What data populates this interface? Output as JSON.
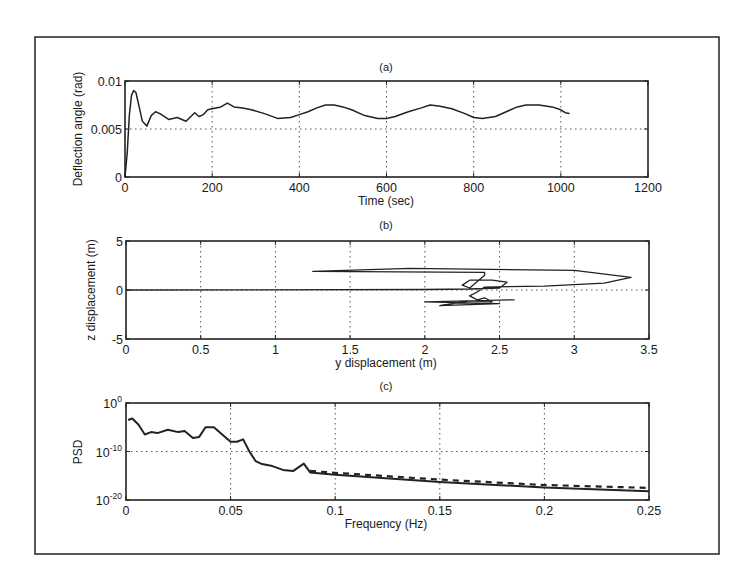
{
  "chart_data": [
    {
      "id": "a",
      "type": "line",
      "title": "(a)",
      "xlabel": "Time (sec)",
      "ylabel": "Deflection angle (rad)",
      "xlim": [
        0,
        1200
      ],
      "ylim": [
        0,
        0.01
      ],
      "xticks": [
        "0",
        "200",
        "400",
        "600",
        "800",
        "1000",
        "1200"
      ],
      "yticks": [
        "0",
        "0.005",
        "0.01"
      ],
      "grid": true,
      "series": [
        {
          "name": "deflection",
          "x": [
            0,
            5,
            10,
            15,
            20,
            25,
            30,
            40,
            50,
            60,
            70,
            80,
            100,
            120,
            140,
            160,
            170,
            180,
            190,
            200,
            220,
            235,
            250,
            270,
            290,
            320,
            350,
            380,
            400,
            420,
            440,
            460,
            480,
            500,
            520,
            550,
            580,
            600,
            620,
            650,
            680,
            700,
            720,
            750,
            780,
            800,
            820,
            850,
            880,
            900,
            920,
            950,
            980,
            1000,
            1010,
            1020
          ],
          "values": [
            0,
            0.0025,
            0.0065,
            0.0085,
            0.009,
            0.0088,
            0.0078,
            0.0058,
            0.0053,
            0.0064,
            0.0068,
            0.0066,
            0.006,
            0.0062,
            0.0058,
            0.0067,
            0.0063,
            0.0065,
            0.007,
            0.0071,
            0.0073,
            0.0077,
            0.0073,
            0.0072,
            0.007,
            0.0066,
            0.0061,
            0.0062,
            0.0065,
            0.0068,
            0.0072,
            0.0075,
            0.0075,
            0.0073,
            0.007,
            0.0064,
            0.0061,
            0.0061,
            0.0063,
            0.0068,
            0.0072,
            0.0075,
            0.0074,
            0.0071,
            0.0066,
            0.0062,
            0.0061,
            0.0063,
            0.0069,
            0.0073,
            0.0075,
            0.0075,
            0.0073,
            0.007,
            0.0067,
            0.0066
          ]
        }
      ]
    },
    {
      "id": "b",
      "type": "line",
      "title": "(b)",
      "xlabel": "y displacement (m)",
      "ylabel": "z displacement (m)",
      "xlim": [
        0,
        3.5
      ],
      "ylim": [
        -5,
        5
      ],
      "xticks": [
        "0",
        "0.5",
        "1",
        "1.5",
        "2",
        "2.5",
        "3",
        "3.5"
      ],
      "yticks": [
        "-5",
        "0",
        "5"
      ],
      "grid": true,
      "series": [
        {
          "name": "trajectory",
          "x": [
            0,
            2.0,
            2.3,
            2.5,
            2.55,
            2.45,
            2.3,
            2.25,
            2.3,
            2.4,
            2.4,
            1.25,
            1.9,
            3.0,
            3.38,
            3.2,
            2.8,
            2.4,
            2.35,
            2.3,
            2.35,
            2.4,
            2.45,
            2.3,
            2.1,
            2.5,
            2.0,
            2.6
          ],
          "values": [
            0,
            0.05,
            0.1,
            0.2,
            0.8,
            1.0,
            1.0,
            0.5,
            0.2,
            1.5,
            1.8,
            1.9,
            2.2,
            2.0,
            1.3,
            0.7,
            0.4,
            0.3,
            -0.2,
            -0.6,
            -1.0,
            -0.8,
            -1.2,
            -1.1,
            -1.6,
            -1.4,
            -1.2,
            -1.0
          ]
        }
      ]
    },
    {
      "id": "c",
      "type": "line",
      "title": "(c)",
      "xlabel": "Frequency (Hz)",
      "ylabel": "PSD",
      "xlim": [
        0,
        0.25
      ],
      "ylim_log10": [
        -20,
        0
      ],
      "xticks": [
        "0",
        "0.05",
        "0.1",
        "0.15",
        "0.2",
        "0.25"
      ],
      "yticks": [
        "10^-20",
        "10^-10",
        "10^0"
      ],
      "yscale": "log",
      "grid": true,
      "series": [
        {
          "name": "PSD (solid)",
          "x": [
            0.001,
            0.003,
            0.006,
            0.009,
            0.012,
            0.015,
            0.02,
            0.025,
            0.028,
            0.032,
            0.035,
            0.038,
            0.042,
            0.046,
            0.05,
            0.053,
            0.056,
            0.059,
            0.062,
            0.065,
            0.07,
            0.075,
            0.08,
            0.085,
            0.088,
            0.1,
            0.15,
            0.2,
            0.25
          ],
          "log10_values": [
            -3.5,
            -3.2,
            -4.5,
            -6.5,
            -6.0,
            -6.2,
            -5.5,
            -6.0,
            -5.8,
            -7.2,
            -7.0,
            -5.0,
            -5.0,
            -6.5,
            -8.0,
            -8.0,
            -7.5,
            -10.0,
            -12.0,
            -12.6,
            -13.0,
            -13.8,
            -14.0,
            -12.5,
            -14.3,
            -14.8,
            -16.3,
            -17.4,
            -18.2
          ]
        },
        {
          "name": "PSD (dashed)",
          "x": [
            0.088,
            0.1,
            0.15,
            0.2,
            0.25
          ],
          "log10_values": [
            -14.0,
            -14.4,
            -15.8,
            -16.9,
            -17.5
          ]
        }
      ]
    }
  ]
}
